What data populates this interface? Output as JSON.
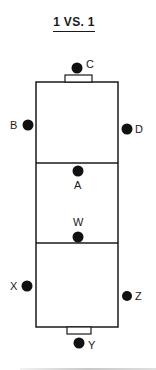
{
  "title": "1 VS. 1",
  "field": {
    "line_color": "#1a1a1a",
    "zones": [
      "top-zone",
      "middle-zone",
      "bottom-zone"
    ]
  },
  "players": [
    {
      "id": "C",
      "label": "C",
      "role": "top-goal"
    },
    {
      "id": "B",
      "label": "B",
      "role": "left-top"
    },
    {
      "id": "D",
      "label": "D",
      "role": "right-top"
    },
    {
      "id": "A",
      "label": "A",
      "role": "center-top"
    },
    {
      "id": "W",
      "label": "W",
      "role": "center-bottom"
    },
    {
      "id": "X",
      "label": "X",
      "role": "left-bottom"
    },
    {
      "id": "Z",
      "label": "Z",
      "role": "right-bottom"
    },
    {
      "id": "Y",
      "label": "Y",
      "role": "bottom-goal"
    }
  ]
}
